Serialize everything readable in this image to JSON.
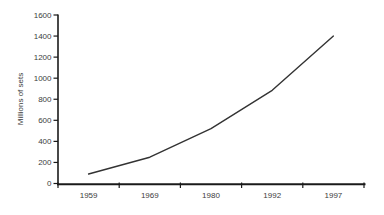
{
  "chart_data": {
    "type": "line",
    "title": "",
    "xlabel": "",
    "ylabel": "Millions of sets",
    "categories": [
      "1959",
      "1969",
      "1980",
      "1992",
      "1997"
    ],
    "values": [
      90,
      250,
      520,
      885,
      1400
    ],
    "ylim": [
      0,
      1600
    ],
    "ytick_step": 200,
    "yticks": [
      0,
      200,
      400,
      600,
      800,
      1000,
      1200,
      1400,
      1600
    ],
    "grid": false,
    "legend": "none",
    "colors": {
      "line": "#333333",
      "axis": "#1a1a1a",
      "text": "#3d3d3d",
      "background": "#ffffff"
    }
  }
}
